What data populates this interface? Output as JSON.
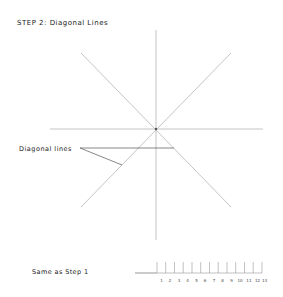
{
  "title": "STEP 2: Diagonal Lines",
  "annotation": {
    "label": "Diagonal lines"
  },
  "ruler": {
    "label": "Same as Step 1",
    "ticks": [
      "1",
      "2",
      "3",
      "4",
      "5",
      "6",
      "7",
      "8",
      "9",
      "10",
      "11",
      "12",
      "13"
    ]
  },
  "colors": {
    "guide_line": "#b0b0b0",
    "leader_line": "#444444",
    "text": "#222222"
  }
}
